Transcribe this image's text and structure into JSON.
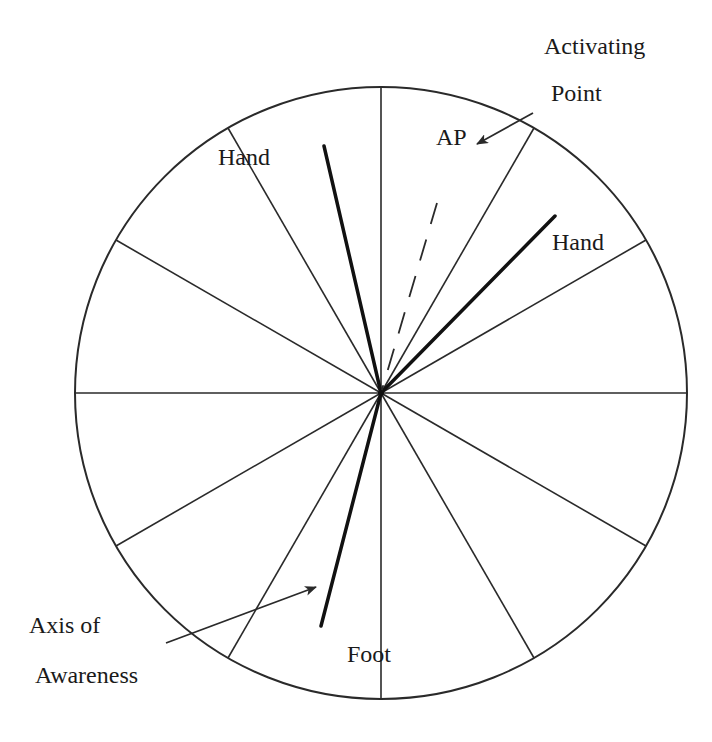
{
  "diagram": {
    "title": "",
    "center": {
      "x": 381,
      "y": 393
    },
    "radius": 306,
    "spoke_count": 12,
    "spoke_angles_deg": [
      0,
      30,
      60,
      90,
      120,
      150,
      180,
      210,
      240,
      270,
      300,
      330
    ],
    "colors": {
      "stroke": "#2a2a2a",
      "background": "#ffffff",
      "text": "#1a1a1a"
    },
    "lines": {
      "left_hand": {
        "from": [
          381,
          393
        ],
        "to": [
          324,
          146
        ],
        "style": "thick"
      },
      "right_hand": {
        "from": [
          381,
          393
        ],
        "to": [
          555,
          216
        ],
        "style": "thick"
      },
      "activating_point": {
        "from": [
          381,
          393
        ],
        "to": [
          437,
          203
        ],
        "style": "dashed"
      },
      "axis_of_awareness": {
        "from": [
          381,
          393
        ],
        "to": [
          321,
          626
        ],
        "style": "thick"
      }
    },
    "arrows": {
      "activating_point_arrow": {
        "from": [
          533,
          113
        ],
        "to": [
          477,
          144
        ]
      },
      "axis_of_awareness_arrow": {
        "from": [
          166,
          643
        ],
        "to": [
          316,
          587
        ]
      }
    },
    "labels": {
      "hand_left": "Hand",
      "ap": "AP",
      "hand_right": "Hand",
      "activating_line1": "Activating",
      "activating_line2": "Point",
      "axis_line1": "Axis of",
      "axis_line2": "Awareness",
      "foot": "Foot"
    }
  }
}
